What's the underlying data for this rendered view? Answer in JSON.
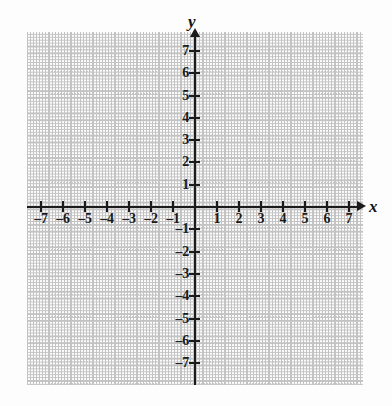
{
  "chart_data": {
    "type": "scatter",
    "title": "",
    "subtitle": "",
    "xlabel": "x",
    "ylabel": "y",
    "xlim": [
      -7.6,
      7.6
    ],
    "ylim": [
      -7.9,
      7.9
    ],
    "x_ticks": [
      -7,
      -6,
      -5,
      -4,
      -3,
      -2,
      -1,
      1,
      2,
      3,
      4,
      5,
      6,
      7
    ],
    "y_ticks": [
      7,
      6,
      5,
      4,
      3,
      2,
      1,
      -1,
      -2,
      -3,
      -4,
      -5,
      -6,
      -7
    ],
    "x_tick_labels": [
      "–7",
      "–6",
      "–5",
      "–4",
      "–3",
      "–2",
      "–1",
      "1",
      "2",
      "3",
      "4",
      "5",
      "6",
      "7"
    ],
    "y_tick_labels": [
      "7",
      "6",
      "5",
      "4",
      "3",
      "2",
      "1",
      "–1",
      "–2",
      "–3",
      "–4",
      "–5",
      "–6",
      "–7"
    ],
    "grid": true,
    "grid_style": "dotted",
    "grid_spacing_units": 1,
    "legend": null,
    "series": [],
    "values": [],
    "annotations": [],
    "origin_label": "",
    "x_axis_arrow": true,
    "y_axis_arrow": true
  },
  "figure": {
    "background_color": "#fdfdfd",
    "axis_color": "#1b1b1b",
    "grid_color": "#bdbdbd",
    "label_color": "#1a1a1a"
  },
  "labels": {
    "x_axis_name": "x",
    "y_axis_name": "y"
  }
}
